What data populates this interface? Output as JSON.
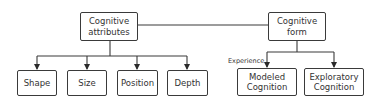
{
  "diagram": {
    "nodes": {
      "attributes": {
        "label": "Cognitive attributes",
        "line1": "Cognitive",
        "line2": "attributes"
      },
      "form": {
        "label": "Cognitive form",
        "line1": "Cognitive",
        "line2": "form"
      },
      "shape": {
        "label": "Shape"
      },
      "size": {
        "label": "Size"
      },
      "position": {
        "label": "Position"
      },
      "depth": {
        "label": "Depth"
      },
      "modeled": {
        "label": "Modeled Cognition",
        "line1": "Modeled",
        "line2": "Cognition"
      },
      "exploratory": {
        "label": "Exploratory Cognition",
        "line1": "Exploratory",
        "line2": "Cognition"
      }
    },
    "edge_labels": {
      "experience": "Experience"
    },
    "edges": [
      {
        "from": "attributes",
        "to": "form",
        "type": "line"
      },
      {
        "from": "attributes",
        "to": "shape",
        "type": "arrow"
      },
      {
        "from": "attributes",
        "to": "size",
        "type": "arrow"
      },
      {
        "from": "attributes",
        "to": "position",
        "type": "arrow"
      },
      {
        "from": "attributes",
        "to": "depth",
        "type": "arrow"
      },
      {
        "from": "form",
        "to": "modeled",
        "type": "arrow",
        "label": "Experience"
      },
      {
        "from": "form",
        "to": "exploratory",
        "type": "arrow"
      }
    ],
    "colors": {
      "stroke": "#3a3a3a",
      "text": "#333333",
      "background": "#ffffff"
    }
  }
}
